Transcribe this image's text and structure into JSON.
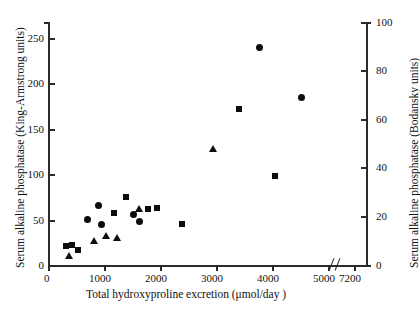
{
  "chart_data": {
    "type": "scatter",
    "title": "",
    "xlabel": "Total hydroxyproline excretion (μmol/day )",
    "ylabel_left": "Serum alkaline phosphatase (King-Armstrong units)",
    "ylabel_right": "Serum alkaline phosphatase (Bodansky units)",
    "xlim": [
      0,
      5400
    ],
    "ylim_left": [
      0,
      270
    ],
    "ylim_right": [
      0,
      100
    ],
    "xticks": [
      "0",
      "1000",
      "2000",
      "3000",
      "4000",
      "5000",
      "7200"
    ],
    "xtick_values": [
      0,
      1000,
      2000,
      3000,
      4000,
      5000,
      7200
    ],
    "yticks_left": [
      "0",
      "50",
      "100",
      "150",
      "200",
      "250"
    ],
    "ytick_values_left": [
      0,
      50,
      100,
      150,
      200,
      250
    ],
    "yticks_right": [
      "0",
      "20",
      "40",
      "60",
      "80",
      "100"
    ],
    "ytick_values_right": [
      0,
      20,
      40,
      60,
      80,
      100
    ],
    "axis_break": true,
    "axis_break_label": "//",
    "grid": false,
    "legend_position": "none",
    "marker_color": "#0d0d0d",
    "series": [
      {
        "name": "squares",
        "marker": "square",
        "points": [
          {
            "x": 330,
            "y": 21
          },
          {
            "x": 430,
            "y": 22
          },
          {
            "x": 530,
            "y": 17
          },
          {
            "x": 1390,
            "y": 75
          },
          {
            "x": 1180,
            "y": 57
          },
          {
            "x": 1790,
            "y": 62
          },
          {
            "x": 1940,
            "y": 63
          },
          {
            "x": 2400,
            "y": 45
          },
          {
            "x": 4050,
            "y": 98
          },
          {
            "x": 5150,
            "y": 172
          }
        ]
      },
      {
        "name": "circles",
        "marker": "circle",
        "points": [
          {
            "x": 700,
            "y": 50
          },
          {
            "x": 900,
            "y": 66
          },
          {
            "x": 960,
            "y": 45
          },
          {
            "x": 1530,
            "y": 56
          },
          {
            "x": 1640,
            "y": 48
          },
          {
            "x": 3770,
            "y": 240
          },
          {
            "x": 4520,
            "y": 185
          }
        ]
      },
      {
        "name": "triangles",
        "marker": "triangle",
        "points": [
          {
            "x": 380,
            "y": 10
          },
          {
            "x": 820,
            "y": 27
          },
          {
            "x": 1030,
            "y": 33
          },
          {
            "x": 1240,
            "y": 30
          },
          {
            "x": 1630,
            "y": 62
          },
          {
            "x": 2950,
            "y": 128
          }
        ]
      }
    ]
  }
}
